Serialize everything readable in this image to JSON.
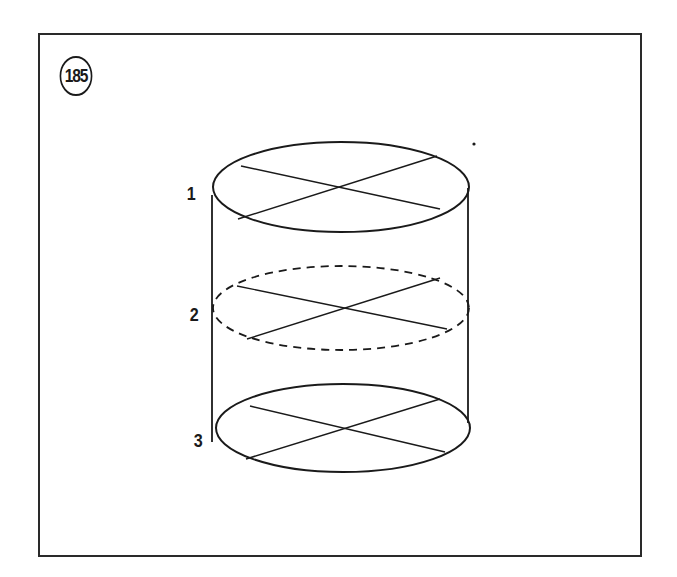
{
  "figure": {
    "number": "185",
    "levels": [
      {
        "label": "1",
        "style": "solid"
      },
      {
        "label": "2",
        "style": "dashed"
      },
      {
        "label": "3",
        "style": "solid"
      }
    ]
  },
  "colors": {
    "ink": "#1a1a1a",
    "frame": "#2a2a2a",
    "background": "#ffffff"
  }
}
